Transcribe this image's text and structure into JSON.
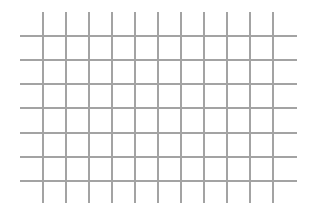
{
  "canvas": {
    "width": 313,
    "height": 222,
    "background": "#ffffff"
  },
  "grid": {
    "line_color": "#a3a3a3",
    "line_width": 2,
    "vertical_lines": {
      "count": 11,
      "x_positions": [
        43,
        66,
        89,
        112,
        135,
        158,
        181,
        204,
        227,
        250,
        273
      ],
      "y_start": 12,
      "y_end": 203
    },
    "horizontal_lines": {
      "count": 7,
      "y_positions": [
        36,
        60,
        84,
        108,
        133,
        157,
        181
      ],
      "x_start": 20,
      "x_end": 297
    }
  }
}
